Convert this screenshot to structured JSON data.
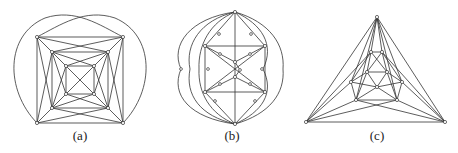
{
  "figure": {
    "panels": [
      {
        "id": "a",
        "label": "(a)",
        "label_x": 80,
        "description": "Three nested squares with diagonal connections and two outer looping arcs"
      },
      {
        "id": "b",
        "label": "(b)",
        "label_x": 232,
        "description": "Octahedral graph with subdivided edges and curved outer edges"
      },
      {
        "id": "c",
        "label": "(c)",
        "label_x": 377,
        "description": "Triangular outer frame containing nested polygon triangulation"
      }
    ]
  }
}
